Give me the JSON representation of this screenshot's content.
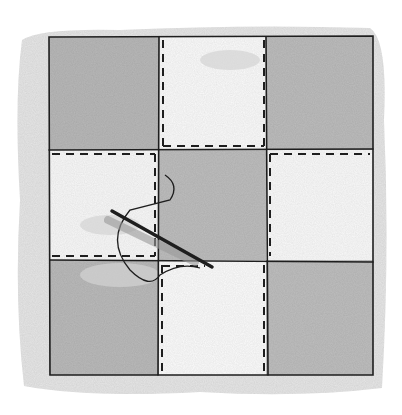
{
  "illustration": {
    "subject": "nine-patch quilt block with needle and thread",
    "grid": {
      "rows": 3,
      "cols": 3
    },
    "patches": [
      {
        "row": 0,
        "col": 0,
        "shade": "dark"
      },
      {
        "row": 0,
        "col": 1,
        "shade": "light"
      },
      {
        "row": 0,
        "col": 2,
        "shade": "dark"
      },
      {
        "row": 1,
        "col": 0,
        "shade": "light"
      },
      {
        "row": 1,
        "col": 1,
        "shade": "dark"
      },
      {
        "row": 1,
        "col": 2,
        "shade": "light"
      },
      {
        "row": 2,
        "col": 0,
        "shade": "dark"
      },
      {
        "row": 2,
        "col": 1,
        "shade": "light"
      },
      {
        "row": 2,
        "col": 2,
        "shade": "dark"
      }
    ],
    "colors": {
      "background": "#ffffff",
      "wash": "#e4e4e4",
      "dark_patch": "#b9b9b9",
      "light_patch": "#fafafa",
      "ink": "#1e1e1e"
    }
  }
}
